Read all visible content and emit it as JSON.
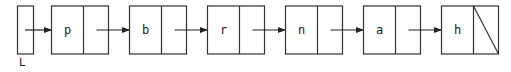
{
  "diagram": {
    "type": "singly-linked-list",
    "head_label": "L",
    "nodes": [
      {
        "value": "p"
      },
      {
        "value": "b"
      },
      {
        "value": "r"
      },
      {
        "value": "n"
      },
      {
        "value": "a"
      },
      {
        "value": "h",
        "next": "null"
      }
    ],
    "colors": {
      "stroke": "#333333",
      "background": "#ffffff",
      "text": "#222222"
    }
  }
}
